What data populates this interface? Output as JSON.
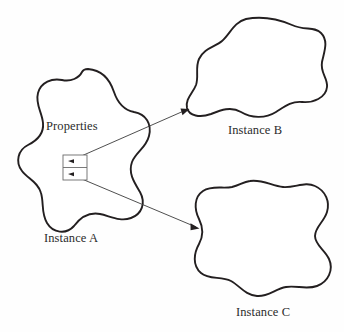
{
  "diagram": {
    "background_color": "#fefefe",
    "stroke_color": "#231f20",
    "connector_color": "#3b3b3b",
    "box_stroke_color": "#6b6b6b",
    "labels": {
      "properties": "Properties",
      "instance_a": "Instance A",
      "instance_b": "Instance B",
      "instance_c": "Instance C"
    },
    "nodes": [
      {
        "id": "instance-a",
        "label": "Instance A",
        "shape": "amoeba-blob"
      },
      {
        "id": "instance-b",
        "label": "Instance B",
        "shape": "rounded-blob"
      },
      {
        "id": "instance-c",
        "label": "Instance C",
        "shape": "wavy-square-blob"
      }
    ],
    "properties_box": {
      "label": "Properties",
      "slot_count": 2,
      "slots": [
        {
          "index": 0,
          "target": "instance-b"
        },
        {
          "index": 1,
          "target": "instance-c"
        }
      ]
    },
    "connectors": [
      {
        "id": "connector-a-to-b",
        "from": "properties-slot-0",
        "to": "instance-b",
        "arrow": "single"
      },
      {
        "id": "connector-a-to-c",
        "from": "properties-slot-1",
        "to": "instance-c",
        "arrow": "single"
      }
    ]
  }
}
